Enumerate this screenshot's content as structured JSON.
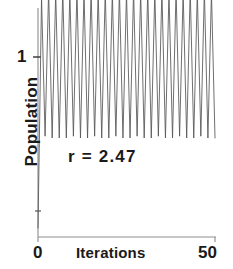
{
  "figure": {
    "name": "logistic-map-population-timeseries",
    "background": "#ffffff",
    "line_color": "#555555",
    "axis_color": "#888888",
    "text_color": "#1a1a1a"
  },
  "axes": {
    "y": {
      "label": "Population",
      "ticks": [
        {
          "value": 1,
          "text": "1"
        }
      ]
    },
    "x": {
      "label": "Iterations",
      "ticks": [
        {
          "value": 0,
          "text": "0"
        },
        {
          "value": 50,
          "text": "50"
        }
      ]
    }
  },
  "annotation": {
    "text": "r  =  2.47"
  },
  "chart_data": {
    "type": "line",
    "title": "",
    "xlabel": "Iterations",
    "ylabel": "Population",
    "xlim": [
      0,
      51
    ],
    "ylim": [
      0,
      1.62
    ],
    "grid": false,
    "legend": null,
    "annotations": [
      {
        "text": "r = 2.47",
        "x": 12,
        "y": 0.62
      }
    ],
    "parameters": {
      "r": 2.47,
      "x0": 0.05
    },
    "series": [
      {
        "name": "population",
        "color": "#555555",
        "x": [
          0,
          1,
          2,
          3,
          4,
          5,
          6,
          7,
          8,
          9,
          10,
          11,
          12,
          13,
          14,
          15,
          16,
          17,
          18,
          19,
          20,
          21,
          22,
          23,
          24,
          25,
          26,
          27,
          28,
          29,
          30,
          31,
          32,
          33,
          34,
          35,
          36,
          37,
          38,
          39,
          40,
          41,
          42,
          43,
          44,
          45,
          46,
          47,
          48,
          49,
          50
        ],
        "values": [
          0.05,
          1.33,
          0.56,
          1.37,
          0.55,
          1.36,
          0.55,
          1.37,
          0.55,
          1.36,
          0.56,
          1.37,
          0.55,
          1.36,
          0.55,
          1.37,
          0.56,
          1.36,
          0.55,
          1.37,
          0.55,
          1.36,
          0.56,
          1.37,
          0.55,
          1.36,
          0.55,
          1.37,
          0.56,
          1.36,
          0.55,
          1.37,
          0.55,
          1.36,
          0.56,
          1.37,
          0.55,
          1.36,
          0.55,
          1.37,
          0.56,
          1.36,
          0.55,
          1.37,
          0.55,
          1.36,
          0.56,
          1.37,
          0.55,
          1.36,
          0.55
        ]
      }
    ]
  }
}
